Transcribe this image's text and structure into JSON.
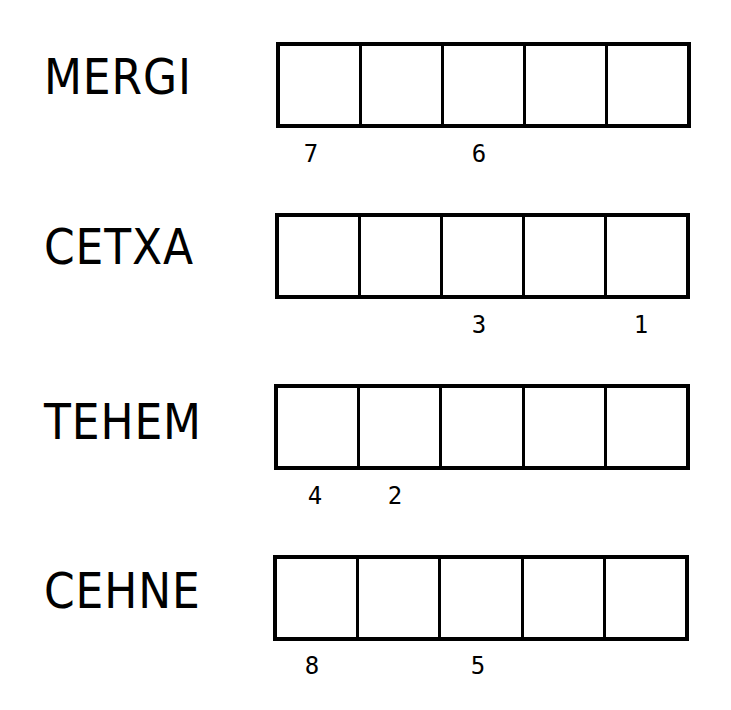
{
  "puzzle": {
    "rows": [
      {
        "word": "MERGI",
        "cells": [
          "",
          "",
          "",
          "",
          ""
        ],
        "hints": [
          "7",
          "",
          "6",
          "",
          ""
        ]
      },
      {
        "word": "CETXA",
        "cells": [
          "",
          "",
          "",
          "",
          ""
        ],
        "hints": [
          "",
          "",
          "3",
          "",
          "1"
        ]
      },
      {
        "word": "TEHEM",
        "cells": [
          "",
          "",
          "",
          "",
          ""
        ],
        "hints": [
          "4",
          "2",
          "",
          "",
          ""
        ]
      },
      {
        "word": "CEHNE",
        "cells": [
          "",
          "",
          "",
          "",
          ""
        ],
        "hints": [
          "8",
          "",
          "5",
          "",
          ""
        ]
      }
    ]
  },
  "colors": {
    "ink": "#000000",
    "background": "#ffffff"
  }
}
